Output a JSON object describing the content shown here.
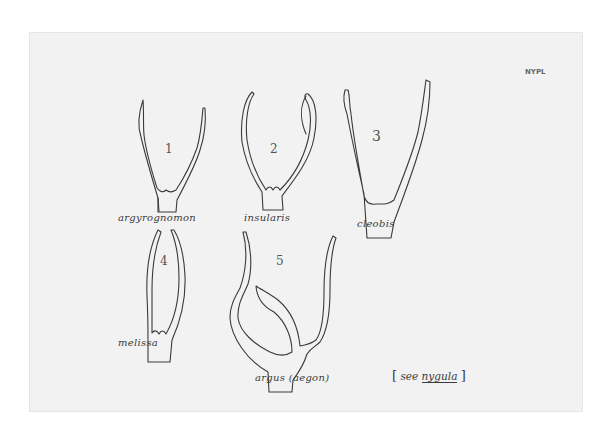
{
  "stamp": "NYPL",
  "figures": [
    {
      "number": "1",
      "label": "argyrognomon"
    },
    {
      "number": "2",
      "label": "insularis"
    },
    {
      "number": "3",
      "label": "cleobis"
    },
    {
      "number": "4",
      "label": "melissa"
    },
    {
      "number": "5",
      "label": "argus (aegon)"
    }
  ],
  "note": {
    "open": "[",
    "prefix": "see",
    "link": "nygula",
    "close": "]"
  },
  "colors": {
    "paper": "#f2f2f2",
    "ink": "#3a3a3a",
    "background": "#ffffff"
  }
}
